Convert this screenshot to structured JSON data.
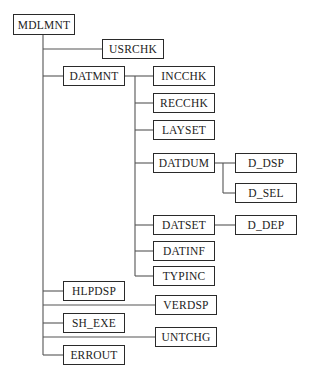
{
  "diagram": {
    "type": "module-hierarchy-tree",
    "line_color": "#555555",
    "box_border_color": "#2a2a2a",
    "nodes": [
      {
        "id": "MDLMNT",
        "label": "MDLMNT",
        "x": 13,
        "y": 14,
        "w": 62,
        "h": 21
      },
      {
        "id": "USRCHK",
        "label": "USRCHK",
        "x": 102,
        "y": 39,
        "w": 62,
        "h": 20
      },
      {
        "id": "DATMNT",
        "label": "DATMNT",
        "x": 63,
        "y": 66,
        "w": 62,
        "h": 20
      },
      {
        "id": "INCCHK",
        "label": "INCCHK",
        "x": 153,
        "y": 66,
        "w": 62,
        "h": 20
      },
      {
        "id": "RECCHK",
        "label": "RECCHK",
        "x": 153,
        "y": 93,
        "w": 62,
        "h": 20
      },
      {
        "id": "LAYSET",
        "label": "LAYSET",
        "x": 153,
        "y": 120,
        "w": 62,
        "h": 20
      },
      {
        "id": "DATDUM",
        "label": "DATDUM",
        "x": 153,
        "y": 153,
        "w": 62,
        "h": 20
      },
      {
        "id": "D_DSP",
        "label": "D_DSP",
        "x": 235,
        "y": 153,
        "w": 62,
        "h": 20
      },
      {
        "id": "D_SEL",
        "label": "D_SEL",
        "x": 235,
        "y": 183,
        "w": 62,
        "h": 20
      },
      {
        "id": "DATSET",
        "label": "DATSET",
        "x": 153,
        "y": 215,
        "w": 62,
        "h": 20
      },
      {
        "id": "D_DEP",
        "label": "D_DEP",
        "x": 235,
        "y": 215,
        "w": 62,
        "h": 20
      },
      {
        "id": "DATINF",
        "label": "DATINF",
        "x": 153,
        "y": 241,
        "w": 62,
        "h": 20
      },
      {
        "id": "TYPINC",
        "label": "TYPINC",
        "x": 153,
        "y": 266,
        "w": 62,
        "h": 20
      },
      {
        "id": "HLPDSP",
        "label": "HLPDSP",
        "x": 63,
        "y": 281,
        "w": 62,
        "h": 20
      },
      {
        "id": "VERDSP",
        "label": "VERDSP",
        "x": 155,
        "y": 295,
        "w": 62,
        "h": 20
      },
      {
        "id": "SH_EXE",
        "label": "SH_EXE",
        "x": 63,
        "y": 313,
        "w": 62,
        "h": 20
      },
      {
        "id": "UNTCHG",
        "label": "UNTCHG",
        "x": 155,
        "y": 327,
        "w": 62,
        "h": 20
      },
      {
        "id": "ERROUT",
        "label": "ERROUT",
        "x": 63,
        "y": 345,
        "w": 62,
        "h": 20
      }
    ],
    "edges": [
      {
        "from": "MDLMNT",
        "to": "USRCHK"
      },
      {
        "from": "MDLMNT",
        "to": "DATMNT"
      },
      {
        "from": "MDLMNT",
        "to": "HLPDSP"
      },
      {
        "from": "MDLMNT",
        "to": "VERDSP"
      },
      {
        "from": "MDLMNT",
        "to": "SH_EXE"
      },
      {
        "from": "MDLMNT",
        "to": "UNTCHG"
      },
      {
        "from": "MDLMNT",
        "to": "ERROUT"
      },
      {
        "from": "DATMNT",
        "to": "INCCHK"
      },
      {
        "from": "DATMNT",
        "to": "RECCHK"
      },
      {
        "from": "DATMNT",
        "to": "LAYSET"
      },
      {
        "from": "DATMNT",
        "to": "DATDUM"
      },
      {
        "from": "DATMNT",
        "to": "DATSET"
      },
      {
        "from": "DATMNT",
        "to": "DATINF"
      },
      {
        "from": "DATMNT",
        "to": "TYPINC"
      },
      {
        "from": "DATDUM",
        "to": "D_DSP"
      },
      {
        "from": "DATDUM",
        "to": "D_SEL"
      },
      {
        "from": "DATSET",
        "to": "D_DEP"
      }
    ]
  }
}
